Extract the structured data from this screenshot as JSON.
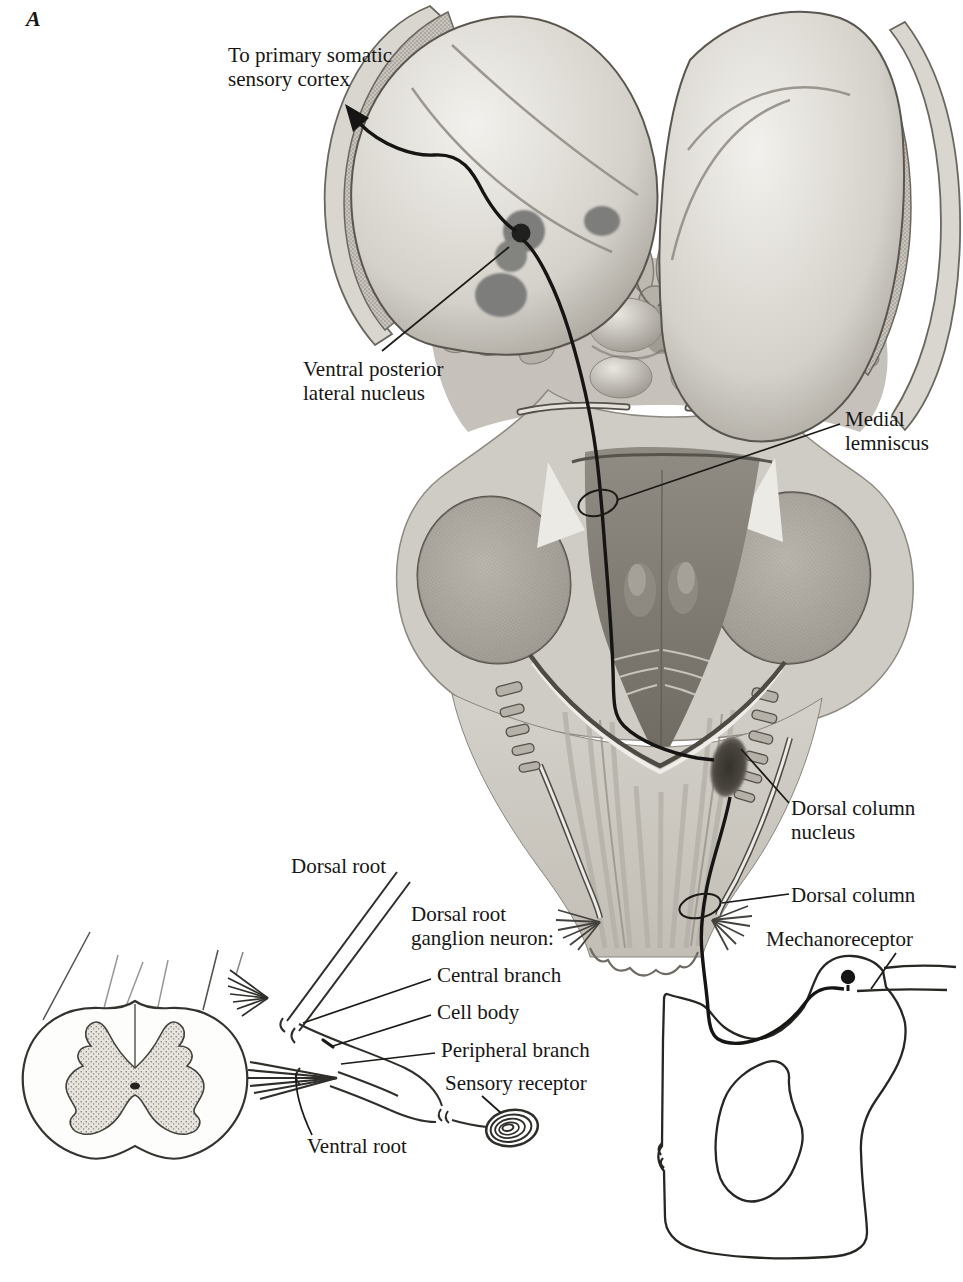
{
  "figure": {
    "panel_label": "A"
  },
  "labels": {
    "primary_somatic_cortex": {
      "line1": "To primary somatic",
      "line2": "sensory cortex"
    },
    "ventral_posterior_lateral_nucleus": {
      "line1": "Ventral posterior",
      "line2": "lateral nucleus"
    },
    "medial_lemniscus": {
      "line1": "Medial",
      "line2": "lemniscus"
    },
    "dorsal_column_nucleus": {
      "line1": "Dorsal column",
      "line2": "nucleus"
    },
    "dorsal_column": {
      "text": "Dorsal column"
    },
    "mechanoreceptor": {
      "text": "Mechanoreceptor"
    },
    "dorsal_root": {
      "text": "Dorsal root"
    },
    "dorsal_root_ganglion_neuron": {
      "line1": "Dorsal root",
      "line2": "ganglion neuron:"
    },
    "central_branch": {
      "text": "Central branch"
    },
    "cell_body": {
      "text": "Cell body"
    },
    "peripheral_branch": {
      "text": "Peripheral branch"
    },
    "sensory_receptor": {
      "text": "Sensory receptor"
    },
    "ventral_root": {
      "text": "Ventral root"
    }
  },
  "colors": {
    "ink": "#1b1a17",
    "paper": "#ffffff",
    "nucleus_dot_gray": "#7d7d7b",
    "dark_nucleus": "#3c3831"
  }
}
